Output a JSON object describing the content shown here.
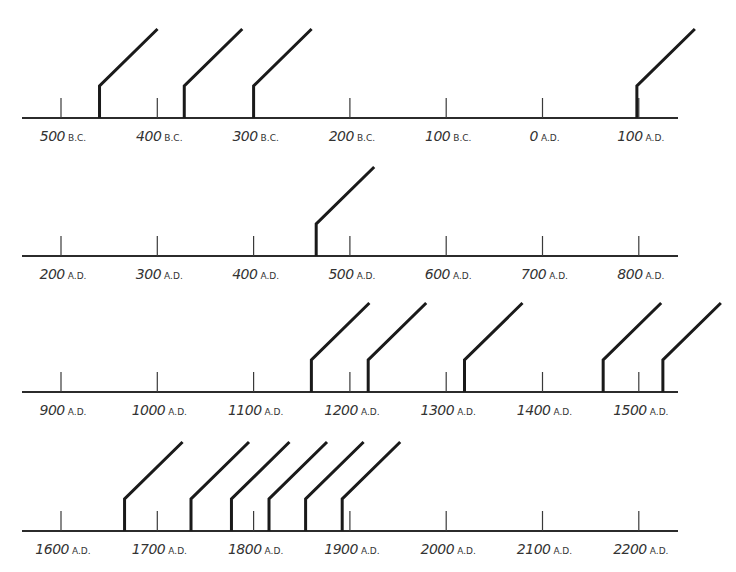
{
  "colors": {
    "axis": "#2b2b2b",
    "tick": "#3a3a3a",
    "marker": "#1a1a1a",
    "label": "#333333",
    "background": "#ffffff"
  },
  "chart_data": {
    "type": "timeline",
    "title": "",
    "rows": [
      {
        "ticks": [
          {
            "num": "500",
            "era": "B.C.",
            "year": -500
          },
          {
            "num": "400",
            "era": "B.C.",
            "year": -400
          },
          {
            "num": "300",
            "era": "B.C.",
            "year": -300
          },
          {
            "num": "200",
            "era": "B.C.",
            "year": -200
          },
          {
            "num": "100",
            "era": "B.C.",
            "year": -100
          },
          {
            "num": "0",
            "era": "A.D.",
            "year": 0
          },
          {
            "num": "100",
            "era": "A.D.",
            "year": 100
          }
        ],
        "markers_years": [
          -460,
          -372,
          -300,
          98
        ]
      },
      {
        "ticks": [
          {
            "num": "200",
            "era": "A.D.",
            "year": 200
          },
          {
            "num": "300",
            "era": "A.D.",
            "year": 300
          },
          {
            "num": "400",
            "era": "A.D.",
            "year": 400
          },
          {
            "num": "500",
            "era": "A.D.",
            "year": 500
          },
          {
            "num": "600",
            "era": "A.D.",
            "year": 600
          },
          {
            "num": "700",
            "era": "A.D.",
            "year": 700
          },
          {
            "num": "800",
            "era": "A.D.",
            "year": 800
          }
        ],
        "markers_years": [
          465
        ]
      },
      {
        "ticks": [
          {
            "num": "900",
            "era": "A.D.",
            "year": 900
          },
          {
            "num": "1000",
            "era": "A.D.",
            "year": 1000
          },
          {
            "num": "1100",
            "era": "A.D.",
            "year": 1100
          },
          {
            "num": "1200",
            "era": "A.D.",
            "year": 1200
          },
          {
            "num": "1300",
            "era": "A.D.",
            "year": 1300
          },
          {
            "num": "1400",
            "era": "A.D.",
            "year": 1400
          },
          {
            "num": "1500",
            "era": "A.D.",
            "year": 1500
          }
        ],
        "markers_years": [
          1160,
          1219,
          1319,
          1463,
          1525
        ]
      },
      {
        "ticks": [
          {
            "num": "1600",
            "era": "A.D.",
            "year": 1600
          },
          {
            "num": "1700",
            "era": "A.D.",
            "year": 1700
          },
          {
            "num": "1800",
            "era": "A.D.",
            "year": 1800
          },
          {
            "num": "1900",
            "era": "A.D.",
            "year": 1900
          },
          {
            "num": "2000",
            "era": "A.D.",
            "year": 2000
          },
          {
            "num": "2100",
            "era": "A.D.",
            "year": 2100
          },
          {
            "num": "2200",
            "era": "A.D.",
            "year": 2200
          }
        ],
        "markers_years": [
          1666,
          1735,
          1777,
          1816,
          1854,
          1892
        ]
      }
    ],
    "tick_interval_years": 100,
    "grid": false,
    "legend": null
  },
  "layout": {
    "axis_x_start": 22,
    "axis_x_end": 678,
    "first_tick_x": 61,
    "px_per_century": 96.3,
    "row_axis_y": [
      118,
      256,
      392,
      531
    ],
    "tick_height": 20,
    "marker_vertical_height": 32,
    "marker_diag_dx": 58,
    "marker_diag_dy": 57,
    "label_offset_y": 8
  }
}
